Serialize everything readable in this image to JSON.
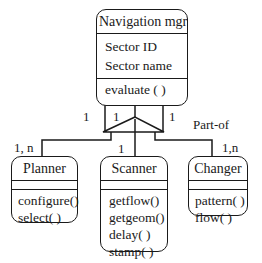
{
  "diagram": {
    "type": "uml-class-diagram",
    "relationship_label": "Part-of",
    "classes": [
      {
        "name": "Navigation mgr",
        "attributes": [
          "Sector ID",
          "Sector name"
        ],
        "methods": [
          "evaluate ( )"
        ]
      },
      {
        "name": "Planner",
        "attributes": [],
        "methods": [
          "configure()",
          "select( )"
        ]
      },
      {
        "name": "Scanner",
        "attributes": [],
        "methods": [
          "getflow()",
          "getgeom()",
          "delay( )",
          "stamp( )"
        ]
      },
      {
        "name": "Changer",
        "attributes": [],
        "methods": [
          "pattern( )",
          "flow( )"
        ]
      }
    ],
    "multiplicities": {
      "parent_to_planner": "1",
      "parent_to_scanner": "1",
      "parent_to_changer": "1",
      "planner_end": "1, n",
      "scanner_end": "1",
      "changer_end": "1,n"
    },
    "colors": {
      "line": "#1a1a1a",
      "background": "#ffffff"
    }
  }
}
